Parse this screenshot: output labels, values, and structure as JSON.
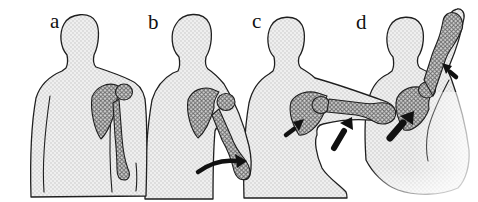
{
  "figure": {
    "panels": [
      {
        "label": "a"
      },
      {
        "label": "b"
      },
      {
        "label": "c"
      },
      {
        "label": "d"
      }
    ],
    "colors": {
      "background": "#ffffff",
      "outline": "#1f1f1f",
      "body_base": "#efefef",
      "body_dot": "#bfbfbf",
      "bone_base": "#d4d4d4",
      "bone_line": "#6a6a6a",
      "arrow": "#111111"
    }
  }
}
